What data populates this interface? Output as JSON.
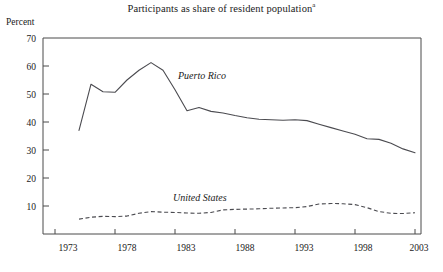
{
  "chart_data": {
    "type": "line",
    "title": "Participants as share of resident population",
    "title_footnote_marker": "a",
    "xlabel": "",
    "ylabel": "Percent",
    "ylim": [
      0,
      70
    ],
    "xlim": [
      1972,
      2003.5
    ],
    "grid": false,
    "legend_position": "inline-annotations",
    "y_ticks": [
      10,
      20,
      30,
      40,
      50,
      60,
      70
    ],
    "x_ticks": [
      1973,
      1978,
      1983,
      1988,
      1993,
      1998,
      2003
    ],
    "x": [
      1975,
      1976,
      1977,
      1978,
      1979,
      1980,
      1981,
      1982,
      1983,
      1984,
      1985,
      1986,
      1987,
      1988,
      1989,
      1990,
      1991,
      1992,
      1993,
      1994,
      1995,
      1996,
      1997,
      1998,
      1999,
      2000,
      2001,
      2002,
      2003
    ],
    "series": [
      {
        "name": "Puerto Rico",
        "style": "solid",
        "color": "#4b4b50",
        "values": [
          37.0,
          53.5,
          50.8,
          50.6,
          55.0,
          58.5,
          61.2,
          58.5,
          51.5,
          44.0,
          45.2,
          43.8,
          43.2,
          42.3,
          41.5,
          41.0,
          40.8,
          40.6,
          40.8,
          40.5,
          39.2,
          38.0,
          36.8,
          35.6,
          34.0,
          33.8,
          32.4,
          30.4,
          29.0
        ]
      },
      {
        "name": "United States",
        "style": "dashed",
        "color": "#4b4b50",
        "values": [
          5.3,
          6.0,
          6.3,
          6.2,
          6.4,
          7.4,
          8.0,
          7.8,
          7.7,
          7.5,
          7.4,
          7.7,
          8.6,
          8.8,
          8.9,
          9.0,
          9.2,
          9.3,
          9.4,
          9.8,
          10.7,
          10.9,
          10.8,
          10.5,
          9.4,
          8.0,
          7.4,
          7.3,
          7.6
        ]
      }
    ],
    "annotations": [
      {
        "text": "Puerto Rico",
        "x_px": 178,
        "y_px": 79
      },
      {
        "text": "United States",
        "x_px": 173,
        "y_px": 201
      }
    ]
  }
}
